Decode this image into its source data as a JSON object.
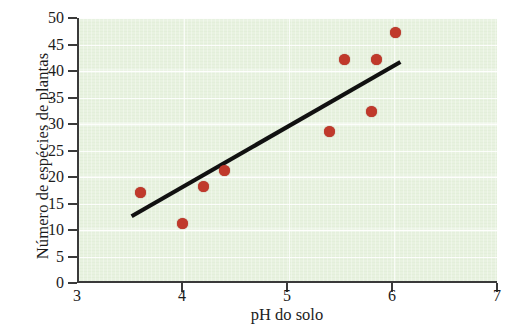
{
  "chart_data": {
    "type": "scatter",
    "title": "",
    "xlabel": "pH do solo",
    "ylabel": "Número de espécies de plantas",
    "xlim": [
      3,
      7
    ],
    "ylim": [
      0,
      50
    ],
    "xticks": [
      3,
      4,
      5,
      6,
      7
    ],
    "yticks": [
      0,
      5,
      10,
      15,
      20,
      25,
      30,
      35,
      40,
      45,
      50
    ],
    "xtick_labels": [
      "3",
      "4",
      "5",
      "6",
      "7"
    ],
    "ytick_labels": [
      "0",
      "5",
      "10",
      "15",
      "20",
      "25",
      "30",
      "35",
      "40",
      "45",
      "50"
    ],
    "grid": true,
    "legend": "none",
    "point_color": "#c0392b",
    "plot_background": "#e8f2e0",
    "axis_color": "#3a3a3a",
    "trendline_color": "#111111",
    "points": [
      {
        "x": 3.6,
        "y": 17.0
      },
      {
        "x": 4.0,
        "y": 11.2
      },
      {
        "x": 4.2,
        "y": 18.2
      },
      {
        "x": 4.4,
        "y": 21.3
      },
      {
        "x": 5.4,
        "y": 28.6
      },
      {
        "x": 5.55,
        "y": 42.2
      },
      {
        "x": 5.8,
        "y": 32.3
      },
      {
        "x": 5.85,
        "y": 42.2
      },
      {
        "x": 6.03,
        "y": 47.2
      }
    ],
    "series": [
      {
        "name": "Número de espécies de plantas",
        "x": [
          3.6,
          4.0,
          4.2,
          4.4,
          5.4,
          5.55,
          5.8,
          5.85,
          6.03
        ],
        "values": [
          17.0,
          11.2,
          18.2,
          21.3,
          28.6,
          42.2,
          32.3,
          42.2,
          47.2
        ]
      }
    ],
    "trendline": {
      "type": "linear-fit",
      "x_start": 3.52,
      "y_start": 12.6,
      "x_end": 6.08,
      "y_end": 41.7
    }
  }
}
